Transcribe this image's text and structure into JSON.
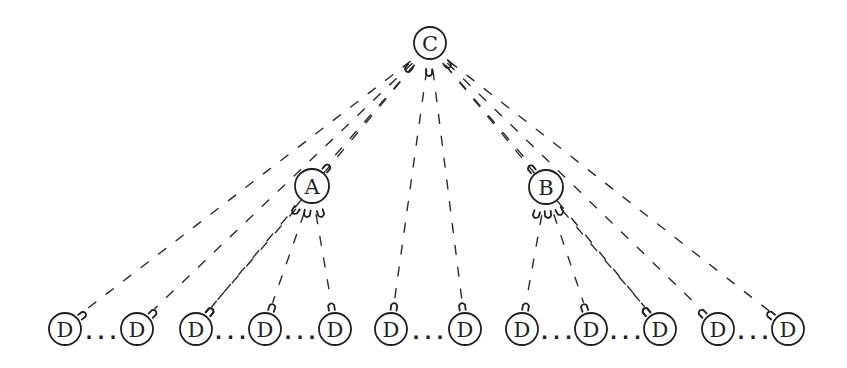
{
  "diagram": {
    "type": "tree",
    "nodes": {
      "root": {
        "label": "C",
        "x": 430,
        "y": 43,
        "r": 16
      },
      "mid": [
        {
          "label": "A",
          "x": 312,
          "y": 186,
          "r": 17
        },
        {
          "label": "B",
          "x": 546,
          "y": 187,
          "r": 17
        }
      ],
      "leaves": [
        {
          "label": "D",
          "x": 65,
          "y": 329
        },
        {
          "label": "D",
          "x": 137,
          "y": 329
        },
        {
          "label": "D",
          "x": 196,
          "y": 329
        },
        {
          "label": "D",
          "x": 265,
          "y": 329
        },
        {
          "label": "D",
          "x": 335,
          "y": 329
        },
        {
          "label": "D",
          "x": 391,
          "y": 329
        },
        {
          "label": "D",
          "x": 465,
          "y": 329
        },
        {
          "label": "D",
          "x": 522,
          "y": 329
        },
        {
          "label": "D",
          "x": 591,
          "y": 329
        },
        {
          "label": "D",
          "x": 660,
          "y": 329
        },
        {
          "label": "D",
          "x": 718,
          "y": 329
        },
        {
          "label": "D",
          "x": 788,
          "y": 329
        }
      ]
    },
    "ellipsis": "...",
    "ellipses_between": [
      [
        0,
        1
      ],
      [
        2,
        3
      ],
      [
        3,
        4
      ],
      [
        5,
        6
      ],
      [
        7,
        8
      ],
      [
        8,
        9
      ],
      [
        10,
        11
      ]
    ],
    "edges": [
      {
        "from": "C",
        "to": "D1"
      },
      {
        "from": "C",
        "to": "D2"
      },
      {
        "from": "C",
        "to": "D3"
      },
      {
        "from": "C",
        "to": "A"
      },
      {
        "from": "C",
        "to": "D6"
      },
      {
        "from": "C",
        "to": "D7"
      },
      {
        "from": "C",
        "to": "B"
      },
      {
        "from": "C",
        "to": "D10"
      },
      {
        "from": "C",
        "to": "D11"
      },
      {
        "from": "C",
        "to": "D12"
      },
      {
        "from": "A",
        "to": "D3"
      },
      {
        "from": "A",
        "to": "D4"
      },
      {
        "from": "A",
        "to": "D5"
      },
      {
        "from": "B",
        "to": "D8"
      },
      {
        "from": "B",
        "to": "D9"
      },
      {
        "from": "B",
        "to": "D10"
      }
    ]
  }
}
